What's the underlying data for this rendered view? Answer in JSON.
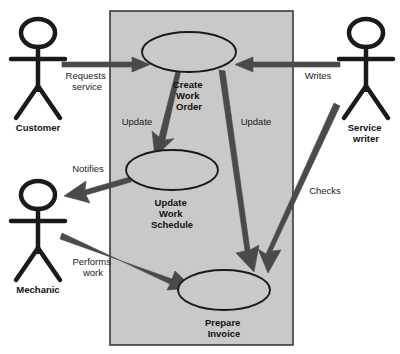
{
  "diagram": {
    "type": "uml-use-case-diagram",
    "colors": {
      "system_boundary_fill": "#c9c9c9",
      "system_boundary_stroke": "#3a3a3a",
      "ellipse_fill": "#c9c9c9",
      "ellipse_stroke": "#1a1a1a",
      "actor_stroke": "#1a1a1a",
      "arrow_fill": "#4a4a4a",
      "text": "#111111",
      "background": "#ffffff"
    },
    "system_boundary": {
      "name": "system-boundary",
      "x": 110,
      "y": 11,
      "width": 183,
      "height": 334
    },
    "use_cases": [
      {
        "id": "create-work-order",
        "label_lines": [
          "Create",
          "Work",
          "Order"
        ],
        "cx": 189,
        "cy": 52,
        "rx": 47,
        "ry": 20,
        "label_x": 189,
        "label_y": 85
      },
      {
        "id": "update-work-schedule",
        "label_lines": [
          "Update",
          "Work",
          "Schedule"
        ],
        "cx": 172,
        "cy": 170,
        "rx": 46,
        "ry": 20,
        "label_x": 172,
        "label_y": 203
      },
      {
        "id": "prepare-invoice",
        "label_lines": [
          "Prepare",
          "Invoice"
        ],
        "cx": 224,
        "cy": 290,
        "rx": 46,
        "ry": 20,
        "label_x": 224,
        "label_y": 323
      }
    ],
    "actors": [
      {
        "id": "customer",
        "label_lines": [
          "Customer"
        ],
        "cx": 38,
        "head_cy": 33,
        "label_y": 128
      },
      {
        "id": "mechanic",
        "label_lines": [
          "Mechanic"
        ],
        "cx": 38,
        "head_cy": 195,
        "label_y": 290
      },
      {
        "id": "service-writer",
        "label_lines": [
          "Service",
          "writer"
        ],
        "cx": 366,
        "head_cy": 33,
        "label_y": 128
      }
    ],
    "associations": [
      {
        "id": "requests-service",
        "label_lines": [
          "Requests",
          "service"
        ],
        "label_x": 87,
        "label_y": 76
      },
      {
        "id": "writes",
        "label_lines": [
          "Writes"
        ],
        "label_x": 318,
        "label_y": 76
      },
      {
        "id": "update-schedule",
        "label_lines": [
          "Update"
        ],
        "label_x": 137,
        "label_y": 122
      },
      {
        "id": "update-invoice",
        "label_lines": [
          "Update"
        ],
        "label_x": 256,
        "label_y": 122
      },
      {
        "id": "notifies",
        "label_lines": [
          "Notifies"
        ],
        "label_x": 88,
        "label_y": 169
      },
      {
        "id": "performs-work",
        "label_lines": [
          "Performs",
          "work"
        ],
        "label_x": 93,
        "label_y": 262
      },
      {
        "id": "checks",
        "label_lines": [
          "Checks"
        ],
        "label_x": 325,
        "label_y": 191
      }
    ]
  }
}
